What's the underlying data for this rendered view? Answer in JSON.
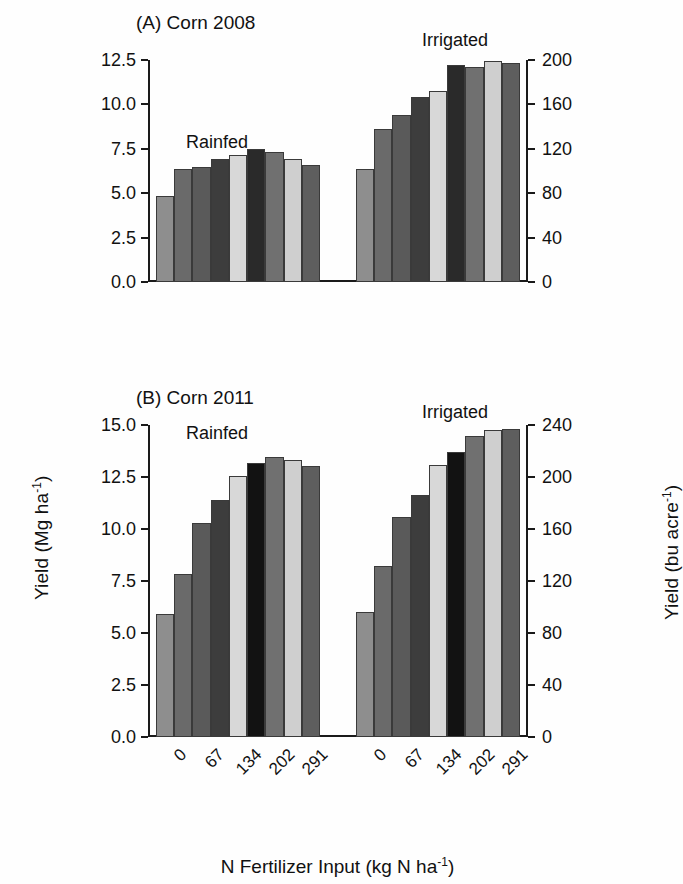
{
  "figure": {
    "y_axis_left_title": "Yield (Mg ha",
    "y_axis_left_title_sup": "-1",
    "y_axis_left_title_end": ")",
    "y_axis_right_title": "Yield (bu acre",
    "y_axis_right_title_sup": "-1",
    "y_axis_right_title_end": ")",
    "x_axis_title": "N Fertilizer Input (kg N ha",
    "x_axis_title_sup": "-1",
    "x_axis_title_end": ")"
  },
  "chart_data": [
    {
      "type": "bar",
      "panel": "A",
      "title": "(A) Corn  2008",
      "xlabel": "N Fertilizer Input (kg N ha-1)",
      "ylabel": "Yield (Mg ha-1)",
      "ylabel_right": "Yield (bu acre-1)",
      "ylim": [
        0.0,
        12.5
      ],
      "ylim_right": [
        0,
        200
      ],
      "yticks": [
        "0.0",
        "2.5",
        "5.0",
        "7.5",
        "10.0",
        "12.5"
      ],
      "ytick_values": [
        0.0,
        2.5,
        5.0,
        7.5,
        10.0,
        12.5
      ],
      "yticks_right": [
        "0",
        "40",
        "80",
        "120",
        "160",
        "200"
      ],
      "ytick_values_right": [
        0,
        40,
        80,
        120,
        160,
        200
      ],
      "grid": false,
      "legend": "none",
      "groups": [
        {
          "name": "Rainfed",
          "categories": [
            "0",
            "67",
            "134",
            "202",
            "291"
          ],
          "values": [
            4.85,
            6.35,
            6.5,
            6.95,
            7.15,
            7.5,
            7.3,
            6.95,
            6.6
          ],
          "shades": [
            "#8e8e8e",
            "#6a6a6a",
            "#5a5a5a",
            "#3d3d3d",
            "#d8d8d8",
            "#2a2a2a",
            "#707070",
            "#cfcfcf",
            "#5e5e5e"
          ]
        },
        {
          "name": "Irrigated",
          "categories": [
            "0",
            "67",
            "134",
            "202",
            "291"
          ],
          "values": [
            6.35,
            8.6,
            9.4,
            10.4,
            10.75,
            12.2,
            12.1,
            12.45,
            12.35
          ],
          "shades": [
            "#8e8e8e",
            "#6a6a6a",
            "#5a5a5a",
            "#3d3d3d",
            "#d8d8d8",
            "#2a2a2a",
            "#707070",
            "#cfcfcf",
            "#5e5e5e"
          ]
        }
      ]
    },
    {
      "type": "bar",
      "panel": "B",
      "title": "(B) Corn  2011",
      "xlabel": "N Fertilizer Input (kg N ha-1)",
      "ylabel": "Yield (Mg ha-1)",
      "ylabel_right": "Yield (bu acre-1)",
      "ylim": [
        0.0,
        15.0
      ],
      "ylim_right": [
        0,
        240
      ],
      "yticks": [
        "0.0",
        "2.5",
        "5.0",
        "7.5",
        "10.0",
        "12.5",
        "15.0"
      ],
      "ytick_values": [
        0.0,
        2.5,
        5.0,
        7.5,
        10.0,
        12.5,
        15.0
      ],
      "yticks_right": [
        "0",
        "40",
        "80",
        "120",
        "160",
        "200",
        "240"
      ],
      "ytick_values_right": [
        0,
        40,
        80,
        120,
        160,
        200,
        240
      ],
      "grid": false,
      "legend": "none",
      "groups": [
        {
          "name": "Rainfed",
          "categories": [
            "0",
            "67",
            "134",
            "202",
            "291"
          ],
          "values": [
            5.9,
            7.85,
            10.3,
            11.4,
            12.55,
            13.15,
            13.45,
            13.3,
            13.05
          ],
          "shades": [
            "#8e8e8e",
            "#6a6a6a",
            "#5a5a5a",
            "#3d3d3d",
            "#d8d8d8",
            "#121212",
            "#707070",
            "#cfcfcf",
            "#5e5e5e"
          ]
        },
        {
          "name": "Irrigated",
          "categories": [
            "0",
            "67",
            "134",
            "202",
            "291"
          ],
          "values": [
            6.0,
            8.2,
            10.6,
            11.65,
            13.1,
            13.7,
            14.45,
            14.75,
            14.8
          ],
          "shades": [
            "#8e8e8e",
            "#6a6a6a",
            "#5a5a5a",
            "#3d3d3d",
            "#d8d8d8",
            "#121212",
            "#707070",
            "#cfcfcf",
            "#5e5e5e"
          ]
        }
      ]
    }
  ],
  "panelA": {
    "title": "(A) Corn  2008",
    "group_rainfed_label": "Rainfed",
    "group_irrigated_label": "Irrigated"
  },
  "panelB": {
    "title": "(B) Corn  2011",
    "group_rainfed_label": "Rainfed",
    "group_irrigated_label": "Irrigated",
    "xlabels_rainfed": [
      "0",
      "67",
      "134",
      "202",
      "291"
    ],
    "xlabels_irrigated": [
      "0",
      "67",
      "134",
      "202",
      "291"
    ]
  }
}
